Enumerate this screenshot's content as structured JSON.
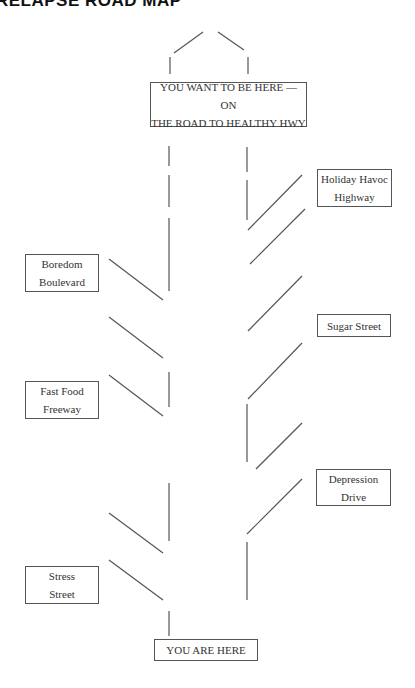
{
  "title": "RELAPSE ROAD MAP",
  "destination": {
    "line1": "YOU WANT TO BE HERE — ON",
    "line2": "THE ROAD TO HEALTHY HWY"
  },
  "start": {
    "label": "YOU ARE HERE"
  },
  "left_exits": [
    {
      "line1": "Boredom",
      "line2": "Boulevard"
    },
    {
      "line1": "Fast Food",
      "line2": "Freeway"
    },
    {
      "line1": "Stress",
      "line2": "Street"
    }
  ],
  "right_exits": [
    {
      "line1": "Holiday Havoc",
      "line2": "Highway"
    },
    {
      "line1": "Sugar Street",
      "line2": ""
    },
    {
      "line1": "Depression",
      "line2": "Drive"
    }
  ]
}
